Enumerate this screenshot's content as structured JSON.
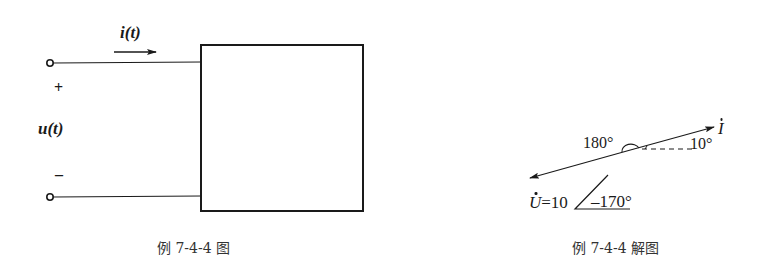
{
  "left_figure": {
    "current_label": "i(t)",
    "voltage_label": "u(t)",
    "plus_sign": "+",
    "minus_sign": "–",
    "caption": "例 7-4-4 图"
  },
  "right_figure": {
    "current_phasor_label": "I",
    "voltage_phasor_label": "U",
    "voltage_value": "=10",
    "voltage_angle": "–170°",
    "angle_180": "180°",
    "angle_10": "10°",
    "caption": "例 7-4-4 解图"
  },
  "colors": {
    "stroke": "#1a1a1a",
    "background": "#ffffff"
  }
}
